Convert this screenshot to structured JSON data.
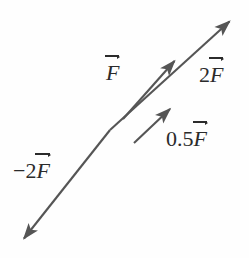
{
  "figure": {
    "kind": "vector-diagram",
    "background_color": "#fefefe",
    "stroke_color": "#555555",
    "text_color": "#2b2b2b",
    "width": 249,
    "height": 258
  },
  "labels": {
    "F": {
      "coefficient": "",
      "symbol": "F"
    },
    "two_F": {
      "coefficient": "2",
      "symbol": "F"
    },
    "half_F": {
      "coefficient": "0.5",
      "symbol": "F"
    },
    "neg_two_F": {
      "coefficient": "−2",
      "symbol": "F"
    }
  },
  "vectors": [
    {
      "name": "2F",
      "label": "2F",
      "direction_degrees": 45,
      "relative_magnitude": 2,
      "tail": [
        110,
        130
      ],
      "head": [
        234,
        16
      ],
      "arrowhead": "head-end"
    },
    {
      "name": "F",
      "label": "F",
      "direction_degrees": 45,
      "relative_magnitude": 1,
      "tail": [
        123,
        119
      ],
      "head": [
        179,
        56
      ],
      "arrowhead": "head-end"
    },
    {
      "name": "0.5F",
      "label": "0.5F",
      "direction_degrees": 45,
      "relative_magnitude": 0.5,
      "tail": [
        134,
        143
      ],
      "head": [
        174,
        104
      ],
      "arrowhead": "head-end"
    },
    {
      "name": "-2F",
      "label": "−2F",
      "direction_degrees": 225,
      "relative_magnitude": 2,
      "tail": [
        110,
        130
      ],
      "head": [
        19,
        244
      ],
      "arrowhead": "head-end"
    }
  ]
}
